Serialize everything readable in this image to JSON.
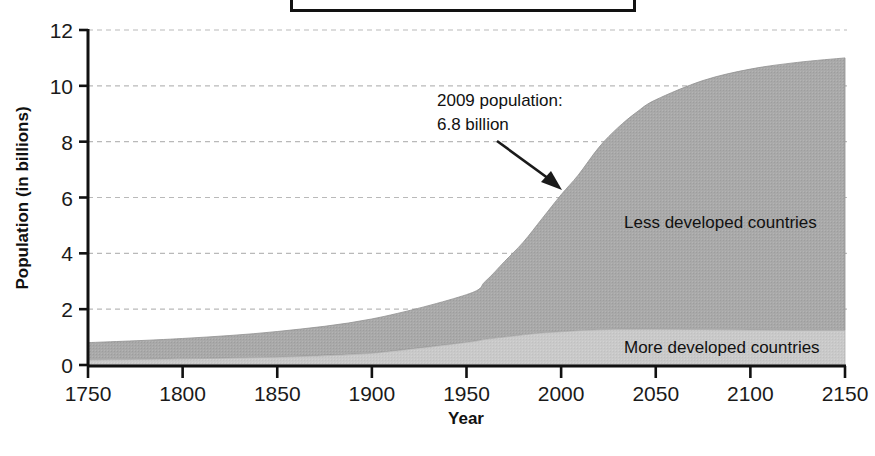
{
  "figure": {
    "title_box_label": ""
  },
  "chart_data": {
    "type": "area",
    "title": "",
    "subtitle": "",
    "xlabel": "Year",
    "ylabel": "Population (in billions)",
    "xlim": [
      1750,
      2150
    ],
    "ylim": [
      0,
      12
    ],
    "xticks": [
      1750,
      1800,
      1850,
      1900,
      1950,
      2000,
      2050,
      2100,
      2150
    ],
    "xtick_labels": [
      "1750",
      "1800",
      "1850",
      "1900",
      "1950",
      "2000",
      "2050",
      "2100",
      "2150"
    ],
    "yticks": [
      0,
      2,
      4,
      6,
      8,
      10,
      12
    ],
    "ytick_labels": [
      "0",
      "2",
      "4",
      "6",
      "8",
      "10",
      "12"
    ],
    "grid": true,
    "grid_style": "dotted",
    "grid_color": "#b9b9b9",
    "stacked": true,
    "legend_position": "inline-labels",
    "x": [
      1750,
      1800,
      1850,
      1900,
      1950,
      1960,
      1970,
      1980,
      1990,
      2000,
      2009,
      2020,
      2030,
      2040,
      2050,
      2075,
      2100,
      2125,
      2150
    ],
    "series": [
      {
        "name": "More developed countries",
        "label_position": "lower-right",
        "color": "#c8c8c8",
        "values": [
          0.18,
          0.22,
          0.28,
          0.42,
          0.81,
          0.92,
          1.0,
          1.08,
          1.15,
          1.19,
          1.23,
          1.26,
          1.28,
          1.28,
          1.28,
          1.27,
          1.25,
          1.24,
          1.24
        ]
      },
      {
        "name": "Less developed countries",
        "label_position": "middle-right",
        "color": "#a9a9a9",
        "values": [
          0.62,
          0.73,
          0.92,
          1.23,
          1.71,
          2.08,
          2.7,
          3.32,
          4.1,
          4.91,
          5.57,
          6.54,
          7.22,
          7.78,
          8.22,
          8.92,
          9.35,
          9.6,
          9.76
        ]
      }
    ],
    "totals": [
      0.8,
      0.95,
      1.2,
      1.65,
      2.52,
      3.0,
      3.7,
      4.4,
      5.25,
      6.1,
      6.8,
      7.8,
      8.5,
      9.06,
      9.5,
      10.19,
      10.6,
      10.84,
      11.0
    ],
    "annotations": [
      {
        "name": "population-2009",
        "line1": "2009 population:",
        "line2": "6.8 billion",
        "points_to_year": 2009,
        "points_to_value": 6.8
      }
    ]
  }
}
